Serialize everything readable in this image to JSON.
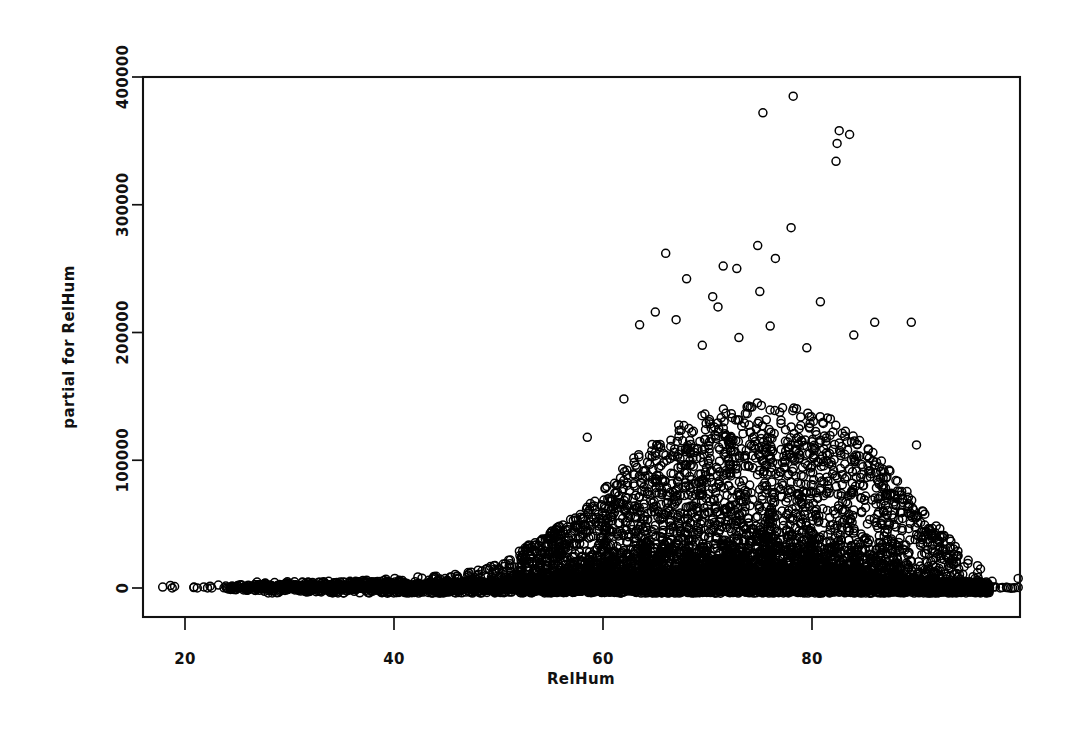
{
  "figure": {
    "title": "",
    "background_color": "#ffffff",
    "foreground_color": "#000000"
  },
  "axes": {
    "x_label": "RelHum",
    "y_label": "partial for RelHum",
    "x_ticks": [
      "20",
      "40",
      "60",
      "80"
    ],
    "y_ticks": [
      "0",
      "100000",
      "200000",
      "300000",
      "400000"
    ]
  },
  "chart_data": {
    "type": "scatter",
    "title": "",
    "xlabel": "RelHum",
    "ylabel": "partial for RelHum",
    "xlim": [
      16.5,
      100.5
    ],
    "ylim": [
      -25000,
      405000
    ],
    "xticks": [
      20,
      40,
      60,
      80
    ],
    "yticks": [
      0,
      100000,
      200000,
      300000,
      400000
    ],
    "grid": false,
    "legend": null,
    "marker": "open-circle",
    "marker_size_px": 8,
    "marker_color": "#000000",
    "n_points_approx": 9000,
    "density_profile": {
      "x_bins": [
        18,
        22,
        26,
        30,
        34,
        38,
        42,
        46,
        50,
        54,
        58,
        62,
        66,
        70,
        74,
        78,
        82,
        86,
        90,
        94,
        98
      ],
      "counts": [
        4,
        6,
        30,
        70,
        130,
        200,
        260,
        330,
        420,
        560,
        720,
        900,
        1050,
        1150,
        1180,
        1100,
        900,
        640,
        380,
        150,
        30
      ],
      "spread_upper": [
        2000,
        2500,
        4000,
        5000,
        6000,
        7000,
        9000,
        12000,
        20000,
        34000,
        55000,
        85000,
        110000,
        125000,
        130000,
        128000,
        118000,
        95000,
        60000,
        28000,
        8000
      ]
    },
    "outliers": [
      {
        "x": 78.2,
        "y": 385000
      },
      {
        "x": 75.3,
        "y": 372000
      },
      {
        "x": 82.6,
        "y": 358000
      },
      {
        "x": 83.6,
        "y": 355000
      },
      {
        "x": 82.4,
        "y": 348000
      },
      {
        "x": 82.3,
        "y": 334000
      },
      {
        "x": 78.0,
        "y": 282000
      },
      {
        "x": 74.8,
        "y": 268000
      },
      {
        "x": 66.0,
        "y": 262000
      },
      {
        "x": 76.5,
        "y": 258000
      },
      {
        "x": 71.5,
        "y": 252000
      },
      {
        "x": 72.8,
        "y": 250000
      },
      {
        "x": 68.0,
        "y": 242000
      },
      {
        "x": 75.0,
        "y": 232000
      },
      {
        "x": 70.5,
        "y": 228000
      },
      {
        "x": 71.0,
        "y": 220000
      },
      {
        "x": 80.8,
        "y": 224000
      },
      {
        "x": 65.0,
        "y": 216000
      },
      {
        "x": 67.0,
        "y": 210000
      },
      {
        "x": 63.5,
        "y": 206000
      },
      {
        "x": 76.0,
        "y": 205000
      },
      {
        "x": 86.0,
        "y": 208000
      },
      {
        "x": 89.5,
        "y": 208000
      },
      {
        "x": 84.0,
        "y": 198000
      },
      {
        "x": 73.0,
        "y": 196000
      },
      {
        "x": 69.5,
        "y": 190000
      },
      {
        "x": 79.5,
        "y": 188000
      },
      {
        "x": 62.0,
        "y": 148000
      },
      {
        "x": 58.5,
        "y": 118000
      },
      {
        "x": 90.0,
        "y": 112000
      }
    ]
  },
  "layout": {
    "plot_left_px": 143,
    "plot_right_px": 1020,
    "plot_top_px": 77,
    "plot_bottom_px": 617
  }
}
